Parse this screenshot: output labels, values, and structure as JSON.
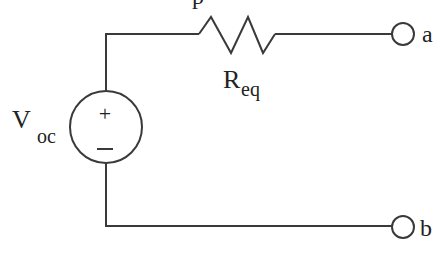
{
  "diagram": {
    "type": "circuit",
    "title_fragment": "p",
    "source": {
      "label_main": "V",
      "label_sub": "oc",
      "plus_symbol": "+",
      "minus_symbol": "−"
    },
    "resistor": {
      "label_main": "R",
      "label_sub": "eq"
    },
    "terminals": [
      {
        "id": "a",
        "label": "a"
      },
      {
        "id": "b",
        "label": "b"
      }
    ],
    "colors": {
      "line": "#3a3a3a",
      "text": "#222222",
      "background": "#ffffff"
    }
  }
}
